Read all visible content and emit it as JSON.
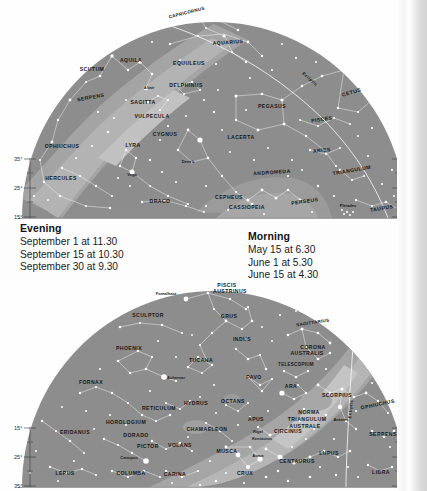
{
  "page": {
    "kind": "star-chart-page",
    "sky_fill": "#8e8e8e",
    "milky_way_fill": "#a8a8a8",
    "milky_way_bright_fill": "#bdbdbd",
    "star_fill": "#ffffff",
    "line_stroke": "#f2f2f2",
    "text_fill": "#17181a"
  },
  "caption": {
    "evening": {
      "heading": "Evening",
      "lines": [
        "September 1 at 11.30",
        "September 15 at 10.30",
        "September 30 at 9.30"
      ]
    },
    "morning": {
      "heading": "Morning",
      "lines": [
        "May 15 at 6.30",
        "June 1 at 5.30",
        "June 15 at 4.30"
      ]
    }
  },
  "chart_data": [
    {
      "id": "north",
      "type": "scatter",
      "title": "",
      "projection": "half-dome northern sky",
      "axis_labels_left": [
        "35°",
        "25°",
        "15°"
      ],
      "axis_labels_right": [
        "35°",
        "25°",
        "15°"
      ],
      "annotations": [
        "Ecliptic"
      ],
      "constellations": [
        {
          "name": "CAPRICORNUS",
          "x": 187,
          "y": 14,
          "rot": -14
        },
        {
          "name": "AQUARIUS",
          "x": 228,
          "y": 44,
          "rot": -4
        },
        {
          "name": "AQUILA",
          "x": 131,
          "y": 62,
          "rot": 0
        },
        {
          "name": "EQUULEUS",
          "x": 189,
          "y": 65,
          "rot": 0
        },
        {
          "name": "SCUTUM",
          "x": 92,
          "y": 71,
          "rot": 0
        },
        {
          "name": "DELPHINUS",
          "x": 186,
          "y": 87,
          "rot": 0
        },
        {
          "name": "CETUS",
          "x": 352,
          "y": 94,
          "rot": -16
        },
        {
          "name": "SERPENS",
          "x": 91,
          "y": 99,
          "rot": -10
        },
        {
          "name": "SAGITTA",
          "x": 143,
          "y": 104,
          "rot": 0
        },
        {
          "name": "PEGASUS",
          "x": 272,
          "y": 108,
          "rot": 0
        },
        {
          "name": "VULPECULA",
          "x": 152,
          "y": 118,
          "rot": 0
        },
        {
          "name": "PISCES",
          "x": 322,
          "y": 121,
          "rot": -8
        },
        {
          "name": "CYGNUS",
          "x": 165,
          "y": 136,
          "rot": 0
        },
        {
          "name": "LACERTA",
          "x": 241,
          "y": 139,
          "rot": 0
        },
        {
          "name": "LYRA",
          "x": 133,
          "y": 147,
          "rot": 0
        },
        {
          "name": "OPHIUCHUS",
          "x": 62,
          "y": 148,
          "rot": 0
        },
        {
          "name": "ARIES",
          "x": 322,
          "y": 152,
          "rot": -6
        },
        {
          "name": "TRIANGULUM",
          "x": 352,
          "y": 172,
          "rot": -10
        },
        {
          "name": "ANDROMEDA",
          "x": 272,
          "y": 174,
          "rot": -4
        },
        {
          "name": "HERCULES",
          "x": 61,
          "y": 180,
          "rot": 0
        },
        {
          "name": "CEPHEUS",
          "x": 229,
          "y": 199,
          "rot": 0
        },
        {
          "name": "DRACO",
          "x": 160,
          "y": 203,
          "rot": 0
        },
        {
          "name": "PERSEUS",
          "x": 305,
          "y": 203,
          "rot": -8
        },
        {
          "name": "CASSIOPEIA",
          "x": 247,
          "y": 209,
          "rot": 0
        },
        {
          "name": "TAURUS",
          "x": 382,
          "y": 210,
          "rot": -10
        }
      ],
      "star_names": [
        {
          "name": "Altair",
          "x": 149,
          "y": 89
        },
        {
          "name": "Deneb",
          "x": 188,
          "y": 163
        },
        {
          "name": "Vega",
          "x": 132,
          "y": 176
        },
        {
          "name": "Pleiades",
          "x": 348,
          "y": 207
        }
      ]
    },
    {
      "id": "south",
      "type": "scatter",
      "title": "",
      "projection": "half-dome southern sky",
      "axis_labels_left": [
        "15°",
        "25°",
        "35°"
      ],
      "axis_labels_right": [
        "15°",
        "25°",
        "35°"
      ],
      "annotations": [
        "Ecliptic"
      ],
      "constellations": [
        {
          "name": "PISCIS",
          "x": 227,
          "y": 6,
          "rot": 0
        },
        {
          "name": "AUSTRINUS",
          "x": 230,
          "y": 12,
          "rot": 0
        },
        {
          "name": "SCULPTOR",
          "x": 148,
          "y": 36,
          "rot": 0
        },
        {
          "name": "GRUS",
          "x": 229,
          "y": 37,
          "rot": 0
        },
        {
          "name": "SAGITTARIUS",
          "x": 313,
          "y": 43,
          "rot": -9
        },
        {
          "name": "INDUS",
          "x": 242,
          "y": 60,
          "rot": 0
        },
        {
          "name": "CORONA",
          "x": 313,
          "y": 68,
          "rot": 0
        },
        {
          "name": "AUSTRALIS",
          "x": 307,
          "y": 74,
          "rot": 0
        },
        {
          "name": "PHOENIX",
          "x": 129,
          "y": 69,
          "rot": 0
        },
        {
          "name": "TUCANA",
          "x": 201,
          "y": 81,
          "rot": 0
        },
        {
          "name": "TELESCOPIUM",
          "x": 296,
          "y": 85,
          "rot": 0
        },
        {
          "name": "PAVO",
          "x": 254,
          "y": 98,
          "rot": 0
        },
        {
          "name": "FORNAX",
          "x": 91,
          "y": 103,
          "rot": 0
        },
        {
          "name": "ARA",
          "x": 291,
          "y": 107,
          "rot": 0
        },
        {
          "name": "SCORPIUS",
          "x": 337,
          "y": 116,
          "rot": 0
        },
        {
          "name": "OPHIUCHUS",
          "x": 378,
          "y": 125,
          "rot": -12
        },
        {
          "name": "HYDRUS",
          "x": 196,
          "y": 124,
          "rot": 0
        },
        {
          "name": "OCTANS",
          "x": 233,
          "y": 122,
          "rot": 0
        },
        {
          "name": "RETICULUM",
          "x": 159,
          "y": 129,
          "rot": 0
        },
        {
          "name": "NORMA",
          "x": 309,
          "y": 133,
          "rot": 0
        },
        {
          "name": "APUS",
          "x": 256,
          "y": 140,
          "rot": 0
        },
        {
          "name": "TRIANGULUM",
          "x": 307,
          "y": 140,
          "rot": 0
        },
        {
          "name": "HOROLOGIUM",
          "x": 126,
          "y": 143,
          "rot": 0
        },
        {
          "name": "AUSTRALE",
          "x": 305,
          "y": 147,
          "rot": 0
        },
        {
          "name": "CIRCINUS",
          "x": 288,
          "y": 152,
          "rot": 0
        },
        {
          "name": "CHAMAELEON",
          "x": 207,
          "y": 150,
          "rot": 0
        },
        {
          "name": "ERIDANUS",
          "x": 75,
          "y": 153,
          "rot": 0
        },
        {
          "name": "SERPENS",
          "x": 383,
          "y": 155,
          "rot": 0
        },
        {
          "name": "DORADO",
          "x": 136,
          "y": 156,
          "rot": 0
        },
        {
          "name": "VOLANS",
          "x": 180,
          "y": 166,
          "rot": 0
        },
        {
          "name": "PICTOR",
          "x": 148,
          "y": 167,
          "rot": 0
        },
        {
          "name": "LUPUS",
          "x": 329,
          "y": 174,
          "rot": 0
        },
        {
          "name": "MUSCA",
          "x": 227,
          "y": 172,
          "rot": 0
        },
        {
          "name": "CENTAURUS",
          "x": 297,
          "y": 182,
          "rot": 0
        },
        {
          "name": "LEPUS",
          "x": 65,
          "y": 194,
          "rot": 0
        },
        {
          "name": "COLUMBA",
          "x": 131,
          "y": 194,
          "rot": 0
        },
        {
          "name": "CARINA",
          "x": 175,
          "y": 195,
          "rot": 0
        },
        {
          "name": "CRUX",
          "x": 245,
          "y": 194,
          "rot": 0
        },
        {
          "name": "LIBRA",
          "x": 381,
          "y": 193,
          "rot": 0
        }
      ],
      "star_names": [
        {
          "name": "Fomalhaut",
          "x": 166,
          "y": 14
        },
        {
          "name": "Achernar",
          "x": 176,
          "y": 98
        },
        {
          "name": "Antares",
          "x": 341,
          "y": 140
        },
        {
          "name": "Rigel",
          "x": 258,
          "y": 152
        },
        {
          "name": "Kentaurus",
          "x": 262,
          "y": 159
        },
        {
          "name": "Canopus",
          "x": 129,
          "y": 178
        },
        {
          "name": "Acrux",
          "x": 258,
          "y": 176
        }
      ]
    }
  ]
}
